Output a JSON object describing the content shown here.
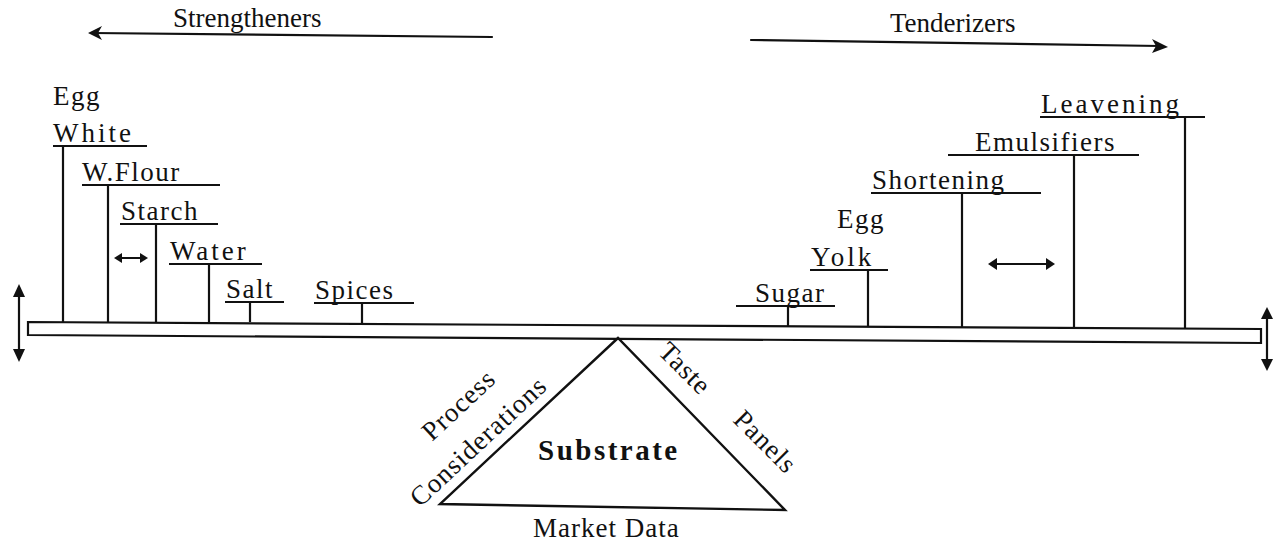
{
  "diagram": {
    "type": "balance-beam",
    "colors": {
      "ink": "#111111",
      "background": "#ffffff"
    },
    "directions": {
      "left": {
        "label": "Strengtheners",
        "arrow": "left"
      },
      "right": {
        "label": "Tenderizers",
        "arrow": "right"
      }
    },
    "strengtheners": [
      {
        "line1": "Egg",
        "line2": "White"
      },
      {
        "line1": "",
        "line2": "W.Flour"
      },
      {
        "line1": "",
        "line2": "Starch"
      },
      {
        "line1": "",
        "line2": "Water"
      },
      {
        "line1": "",
        "line2": "Salt"
      },
      {
        "line1": "",
        "line2": "Spices"
      }
    ],
    "tenderizers": [
      {
        "line1": "",
        "line2": "Sugar"
      },
      {
        "line1": "Egg",
        "line2": "Yolk"
      },
      {
        "line1": "",
        "line2": "Shortening"
      },
      {
        "line1": "",
        "line2": "Emulsifiers"
      },
      {
        "line1": "",
        "line2": "Leavening"
      }
    ],
    "fulcrum": {
      "center": "Substrate",
      "left_side_line1": "Process",
      "left_side_line2": "Considerations",
      "right_side_line1": "Taste",
      "right_side_line2": "Panels",
      "base": "Market Data"
    },
    "icons": {
      "left_direction": "arrow-left-icon",
      "right_direction": "arrow-right-icon",
      "beam_end_left": "vertical-double-arrow-icon",
      "beam_end_right": "vertical-double-arrow-icon",
      "strengthener_spacing": "horizontal-double-arrow-icon",
      "tenderizer_spacing": "horizontal-double-arrow-icon"
    }
  }
}
